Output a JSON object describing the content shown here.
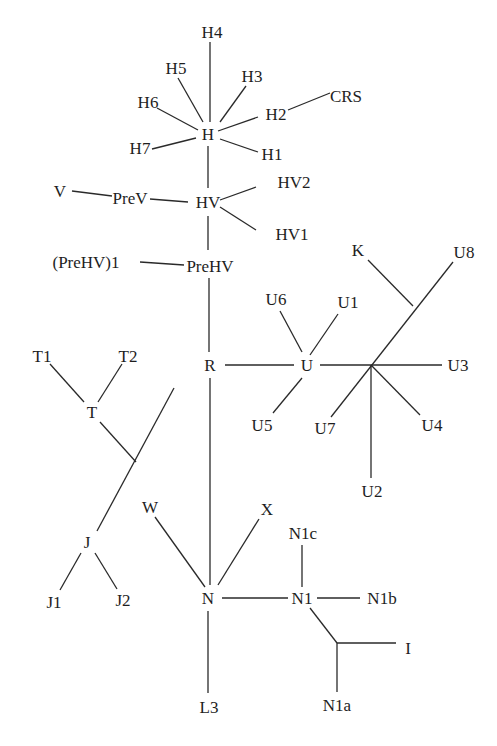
{
  "diagram": {
    "type": "phylogenetic-tree",
    "nodes": [
      {
        "id": "H4",
        "label": "H4",
        "x": 212,
        "y": 32
      },
      {
        "id": "H5",
        "label": "H5",
        "x": 176,
        "y": 68
      },
      {
        "id": "H3",
        "label": "H3",
        "x": 252,
        "y": 76
      },
      {
        "id": "H6",
        "label": "H6",
        "x": 148,
        "y": 102
      },
      {
        "id": "CRS",
        "label": "CRS",
        "x": 346,
        "y": 96
      },
      {
        "id": "H2",
        "label": "H2",
        "x": 276,
        "y": 114
      },
      {
        "id": "H",
        "label": "H",
        "x": 208,
        "y": 134
      },
      {
        "id": "H7",
        "label": "H7",
        "x": 140,
        "y": 148
      },
      {
        "id": "H1",
        "label": "H1",
        "x": 272,
        "y": 154
      },
      {
        "id": "HV2",
        "label": "HV2",
        "x": 294,
        "y": 182
      },
      {
        "id": "V",
        "label": "V",
        "x": 60,
        "y": 191
      },
      {
        "id": "PreV",
        "label": "PreV",
        "x": 130,
        "y": 198
      },
      {
        "id": "HV",
        "label": "HV",
        "x": 208,
        "y": 202
      },
      {
        "id": "HV1",
        "label": "HV1",
        "x": 292,
        "y": 234
      },
      {
        "id": "PreHV1",
        "label": "(PreHV)1",
        "x": 86,
        "y": 262
      },
      {
        "id": "PreHV",
        "label": "PreHV",
        "x": 210,
        "y": 266
      },
      {
        "id": "K",
        "label": "K",
        "x": 358,
        "y": 250
      },
      {
        "id": "U8",
        "label": "U8",
        "x": 464,
        "y": 252
      },
      {
        "id": "U6",
        "label": "U6",
        "x": 276,
        "y": 299
      },
      {
        "id": "U1",
        "label": "U1",
        "x": 348,
        "y": 302
      },
      {
        "id": "T1",
        "label": "T1",
        "x": 42,
        "y": 356
      },
      {
        "id": "T2",
        "label": "T2",
        "x": 128,
        "y": 356
      },
      {
        "id": "R",
        "label": "R",
        "x": 210,
        "y": 365
      },
      {
        "id": "U",
        "label": "U",
        "x": 307,
        "y": 365
      },
      {
        "id": "U3",
        "label": "U3",
        "x": 458,
        "y": 365
      },
      {
        "id": "T",
        "label": "T",
        "x": 92,
        "y": 412
      },
      {
        "id": "U5",
        "label": "U5",
        "x": 262,
        "y": 425
      },
      {
        "id": "U7",
        "label": "U7",
        "x": 325,
        "y": 428
      },
      {
        "id": "U4",
        "label": "U4",
        "x": 432,
        "y": 425
      },
      {
        "id": "U2",
        "label": "U2",
        "x": 372,
        "y": 491
      },
      {
        "id": "W",
        "label": "W",
        "x": 150,
        "y": 507
      },
      {
        "id": "X",
        "label": "X",
        "x": 267,
        "y": 509
      },
      {
        "id": "N1c",
        "label": "N1c",
        "x": 303,
        "y": 533
      },
      {
        "id": "J",
        "label": "J",
        "x": 87,
        "y": 542
      },
      {
        "id": "J1",
        "label": "J1",
        "x": 54,
        "y": 602
      },
      {
        "id": "J2",
        "label": "J2",
        "x": 123,
        "y": 600
      },
      {
        "id": "N",
        "label": "N",
        "x": 208,
        "y": 598
      },
      {
        "id": "N1",
        "label": "N1",
        "x": 302,
        "y": 598
      },
      {
        "id": "N1b",
        "label": "N1b",
        "x": 382,
        "y": 598
      },
      {
        "id": "I",
        "label": "I",
        "x": 408,
        "y": 648
      },
      {
        "id": "L3",
        "label": "L3",
        "x": 209,
        "y": 707
      },
      {
        "id": "N1a",
        "label": "N1a",
        "x": 337,
        "y": 705
      }
    ],
    "edges": [
      [
        210,
        42,
        210,
        122
      ],
      [
        178,
        78,
        203,
        122
      ],
      [
        246,
        86,
        220,
        122
      ],
      [
        157,
        108,
        198,
        130
      ],
      [
        330,
        93,
        288,
        110
      ],
      [
        218,
        131,
        258,
        117
      ],
      [
        152,
        149,
        196,
        138
      ],
      [
        220,
        139,
        258,
        152
      ],
      [
        208,
        146,
        208,
        188
      ],
      [
        220,
        200,
        256,
        187
      ],
      [
        220,
        207,
        256,
        230
      ],
      [
        72,
        191,
        112,
        196
      ],
      [
        150,
        199,
        188,
        202
      ],
      [
        208,
        216,
        208,
        250
      ],
      [
        140,
        262,
        184,
        265
      ],
      [
        209,
        278,
        209,
        352
      ],
      [
        210,
        378,
        210,
        585
      ],
      [
        225,
        365,
        294,
        365
      ],
      [
        320,
        365,
        442,
        365
      ],
      [
        310,
        355,
        338,
        314
      ],
      [
        280,
        311,
        302,
        352
      ],
      [
        302,
        378,
        273,
        413
      ],
      [
        368,
        260,
        413,
        306
      ],
      [
        453,
        262,
        331,
        417
      ],
      [
        371,
        365,
        420,
        415
      ],
      [
        371,
        365,
        371,
        478
      ],
      [
        50,
        364,
        84,
        402
      ],
      [
        122,
        364,
        98,
        402
      ],
      [
        100,
        422,
        136,
        462
      ],
      [
        174,
        388,
        97,
        531
      ],
      [
        81,
        553,
        60,
        590
      ],
      [
        95,
        553,
        117,
        589
      ],
      [
        155,
        517,
        205,
        587
      ],
      [
        259,
        519,
        218,
        585
      ],
      [
        222,
        598,
        288,
        598
      ],
      [
        317,
        598,
        360,
        598
      ],
      [
        302,
        545,
        302,
        587
      ],
      [
        310,
        608,
        337,
        643
      ],
      [
        337,
        643,
        396,
        643
      ],
      [
        337,
        643,
        337,
        692
      ],
      [
        208,
        611,
        208,
        693
      ]
    ]
  }
}
